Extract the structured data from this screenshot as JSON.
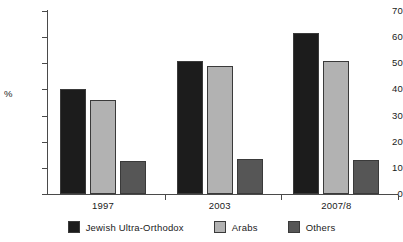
{
  "chart_data": {
    "type": "bar",
    "title": "",
    "subtitle": "",
    "xlabel": "",
    "ylabel": "%",
    "categories": [
      "1997",
      "2003",
      "2007/8"
    ],
    "series": [
      {
        "name": "Jewish Ultra-Orthodox",
        "color": "#1c1c1c",
        "values": [
          40,
          51,
          61.5
        ]
      },
      {
        "name": "Arabs",
        "color": "#b2b2b2",
        "values": [
          36,
          49,
          51
        ]
      },
      {
        "name": "Others",
        "color": "#565656",
        "values": [
          12.5,
          13.5,
          13
        ]
      }
    ],
    "ylim": [
      0,
      70
    ],
    "ytick_step": 10,
    "yticks": [
      0,
      10,
      20,
      30,
      40,
      50,
      60,
      70
    ],
    "ytick_labels": [
      "0",
      "10",
      "20",
      "30",
      "40",
      "50",
      "60",
      "70"
    ],
    "grid": false,
    "legend_position": "bottom",
    "axis_color": "#4a4a4a",
    "bar_outline_color": "#3a3a3a",
    "background": "#ffffff"
  }
}
